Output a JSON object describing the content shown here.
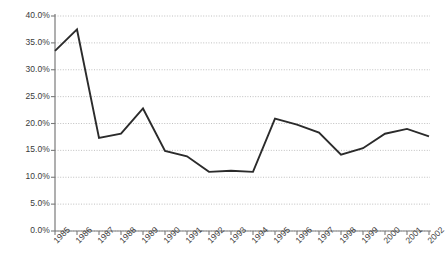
{
  "chart_data": {
    "type": "line",
    "title": "",
    "subtitle": "",
    "xlabel": "",
    "ylabel": "",
    "grid": true,
    "legend": false,
    "legend_position": "none",
    "line_color": "#2b2b2b",
    "grid_color": "#b0b0b0",
    "axis_color": "#808080",
    "label_color": "#3a3a3a",
    "categories": [
      "1985",
      "1986",
      "1987",
      "1988",
      "1989",
      "1990",
      "1991",
      "1992",
      "1993",
      "1994",
      "1995",
      "1996",
      "1997",
      "1998",
      "1999",
      "2000",
      "2001",
      "2002"
    ],
    "x": [
      1985,
      1986,
      1987,
      1988,
      1989,
      1990,
      1991,
      1992,
      1993,
      1994,
      1995,
      1996,
      1997,
      1998,
      1999,
      2000,
      2001,
      2002
    ],
    "values": [
      33.5,
      37.5,
      17.3,
      18.1,
      22.8,
      14.9,
      13.9,
      11.0,
      11.2,
      11.0,
      20.9,
      19.8,
      18.3,
      14.2,
      15.4,
      18.1,
      19.0,
      17.6
    ],
    "ylim": [
      0,
      40
    ],
    "ytick_step": 5,
    "ytick_labels": [
      "0.0%",
      "5.0%",
      "10.0%",
      "15.0%",
      "20.0%",
      "25.0%",
      "30.0%",
      "35.0%",
      "40.0%"
    ],
    "ytick_values": [
      0,
      5,
      10,
      15,
      20,
      25,
      30,
      35,
      40
    ],
    "xlim": [
      1985,
      2002
    ]
  }
}
